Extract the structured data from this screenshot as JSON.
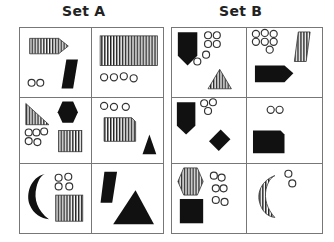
{
  "set_a": {
    "title": "Set A",
    "cells": [
      {
        "position": "row1-left",
        "shapes": [
          "striped pentagon arrow",
          "black parallelogram"
        ],
        "circles": 2
      },
      {
        "position": "row1-right",
        "shapes": [
          "large striped rectangle"
        ],
        "circles": 4
      },
      {
        "position": "row2-left",
        "shapes": [
          "striped right triangle",
          "black hexagon",
          "striped square"
        ],
        "circles": 5
      },
      {
        "position": "row2-right",
        "shapes": [
          "striped rectangle with cut corner",
          "black triangle"
        ],
        "circles": 3
      },
      {
        "position": "row3-left",
        "shapes": [
          "black crescent",
          "striped square"
        ],
        "circles": 4
      },
      {
        "position": "row3-right",
        "shapes": [
          "black parallelogram",
          "large black triangle"
        ],
        "circles": 0
      }
    ]
  },
  "set_b": {
    "title": "Set B",
    "cells": [
      {
        "position": "row1-left",
        "shapes": [
          "black pentagon (shield)",
          "striped triangle"
        ],
        "circles": 6
      },
      {
        "position": "row1-right",
        "shapes": [
          "striped parallelogram",
          "black pentagon arrow"
        ],
        "circles": 7
      },
      {
        "position": "row2-left",
        "shapes": [
          "black pentagon (shield)",
          "black diamond"
        ],
        "circles": 3
      },
      {
        "position": "row2-right",
        "shapes": [
          "black rectangle with cut corner"
        ],
        "circles": 2
      },
      {
        "position": "row3-left",
        "shapes": [
          "striped hexagon",
          "black square"
        ],
        "circles": 6
      },
      {
        "position": "row3-right",
        "shapes": [
          "striped crescent"
        ],
        "circles": 2
      }
    ]
  },
  "colors": {
    "fill": "#111111",
    "stroke": "#333333",
    "grid": "#777777"
  }
}
